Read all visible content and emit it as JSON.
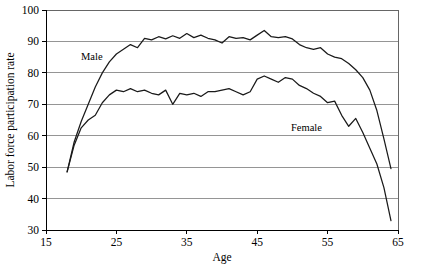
{
  "chart_data": {
    "type": "line",
    "title": "",
    "xlabel": "Age",
    "ylabel": "Labor force participation rate",
    "xlim": [
      15,
      65
    ],
    "ylim": [
      30,
      100
    ],
    "xticks": [
      15,
      25,
      35,
      45,
      55,
      65
    ],
    "yticks": [
      30,
      40,
      50,
      60,
      70,
      80,
      90,
      100
    ],
    "grid": "horizontal",
    "legend_position": "inline-annotations",
    "annotations": [
      {
        "text": "Male",
        "x": 21.5,
        "y": 84.0
      },
      {
        "text": "Female",
        "x": 52.0,
        "y": 61.5
      }
    ],
    "series": [
      {
        "name": "Male",
        "label": "Male",
        "color": "#1a1a1a",
        "x": [
          18,
          19,
          20,
          21,
          22,
          23,
          24,
          25,
          26,
          27,
          28,
          29,
          30,
          31,
          32,
          33,
          34,
          35,
          36,
          37,
          38,
          39,
          40,
          41,
          42,
          43,
          44,
          45,
          46,
          47,
          48,
          49,
          50,
          51,
          52,
          53,
          54,
          55,
          56,
          57,
          58,
          59,
          60,
          61,
          62,
          63,
          64
        ],
        "y": [
          48.5,
          58.0,
          64.5,
          70.0,
          75.5,
          80.0,
          83.5,
          86.0,
          87.5,
          89.0,
          88.0,
          91.0,
          90.5,
          91.5,
          90.8,
          91.8,
          91.0,
          92.5,
          91.2,
          92.0,
          91.0,
          90.5,
          89.5,
          91.5,
          91.0,
          91.2,
          90.5,
          92.0,
          93.5,
          91.5,
          91.2,
          91.5,
          90.8,
          89.0,
          88.0,
          87.5,
          88.0,
          86.0,
          85.0,
          84.5,
          83.0,
          81.0,
          78.5,
          74.5,
          68.0,
          59.0,
          49.5
        ],
        "end_value": 49.5
      },
      {
        "name": "Female",
        "label": "Female",
        "color": "#1a1a1a",
        "x": [
          18,
          19,
          20,
          21,
          22,
          23,
          24,
          25,
          26,
          27,
          28,
          29,
          30,
          31,
          32,
          33,
          34,
          35,
          36,
          37,
          38,
          39,
          40,
          41,
          42,
          43,
          44,
          45,
          46,
          47,
          48,
          49,
          50,
          51,
          52,
          53,
          54,
          55,
          56,
          57,
          58,
          59,
          60,
          61,
          62,
          63,
          64
        ],
        "y": [
          48.5,
          57.0,
          62.5,
          65.0,
          66.5,
          70.5,
          73.0,
          74.5,
          74.0,
          75.0,
          74.0,
          74.5,
          73.5,
          73.0,
          74.5,
          70.0,
          73.5,
          73.0,
          73.5,
          72.5,
          74.0,
          74.0,
          74.5,
          75.0,
          74.0,
          73.0,
          74.0,
          78.0,
          79.0,
          78.0,
          77.0,
          78.5,
          78.0,
          76.0,
          75.0,
          73.5,
          72.5,
          70.5,
          71.0,
          66.5,
          63.0,
          65.5,
          61.0,
          56.0,
          51.0,
          43.5,
          33.0
        ],
        "end_value": 33.0
      }
    ]
  }
}
